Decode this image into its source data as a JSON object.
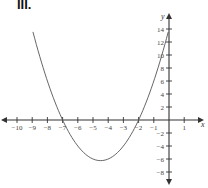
{
  "figure_label": "III.",
  "chart_data": {
    "type": "line",
    "title": "III.",
    "xlabel": "x",
    "ylabel": "y",
    "function": "y = (x + 7)(x + 2)",
    "roots": [
      -7,
      -2
    ],
    "vertex": {
      "x": -4.5,
      "y": -6.25
    },
    "xlim": [
      -11,
      2
    ],
    "ylim": [
      -10,
      16
    ],
    "grid": false,
    "legend": null,
    "x_ticks": [
      -10,
      -9,
      -8,
      -7,
      -6,
      -5,
      -4,
      -3,
      -2,
      -1,
      1
    ],
    "x_tick_labels": [
      "−10",
      "−9",
      "−8",
      "−7",
      "−6",
      "−5",
      "−4",
      "−3",
      "−2",
      "−1",
      "1"
    ],
    "y_ticks": [
      14,
      12,
      10,
      8,
      6,
      4,
      2,
      -2,
      -4,
      -6,
      -8
    ],
    "y_tick_labels": [
      "14",
      "12",
      "10",
      "8",
      "6",
      "4",
      "2",
      "−2",
      "−4",
      "−6",
      "−8"
    ],
    "series": [
      {
        "name": "parabola",
        "x": [
          -8.95,
          -8.5,
          -8,
          -7.5,
          -7,
          -6.5,
          -6,
          -5.5,
          -5,
          -4.5,
          -4,
          -3.5,
          -3,
          -2.5,
          -2,
          -1.5,
          -1,
          -0.5,
          -0.05
        ],
        "y": [
          14.0,
          9.75,
          6.0,
          2.75,
          0.0,
          -2.25,
          -4.0,
          -5.25,
          -6.0,
          -6.25,
          -6.0,
          -5.25,
          -4.0,
          -2.25,
          0.0,
          2.75,
          6.0,
          9.75,
          13.6
        ]
      }
    ],
    "colors": {
      "axis": "#333333",
      "curve": "#555555",
      "labels": "#444444"
    }
  }
}
